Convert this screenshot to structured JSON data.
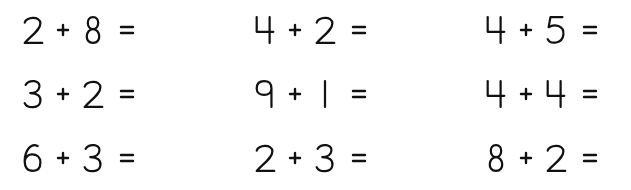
{
  "worksheet": {
    "operator": "+",
    "equals": "=",
    "problems": [
      {
        "a": "2",
        "b": "8"
      },
      {
        "a": "4",
        "b": "2"
      },
      {
        "a": "4",
        "b": "5"
      },
      {
        "a": "3",
        "b": "2"
      },
      {
        "a": "9",
        "b": "1"
      },
      {
        "a": "4",
        "b": "4"
      },
      {
        "a": "6",
        "b": "3"
      },
      {
        "a": "2",
        "b": "3"
      },
      {
        "a": "8",
        "b": "2"
      }
    ]
  }
}
